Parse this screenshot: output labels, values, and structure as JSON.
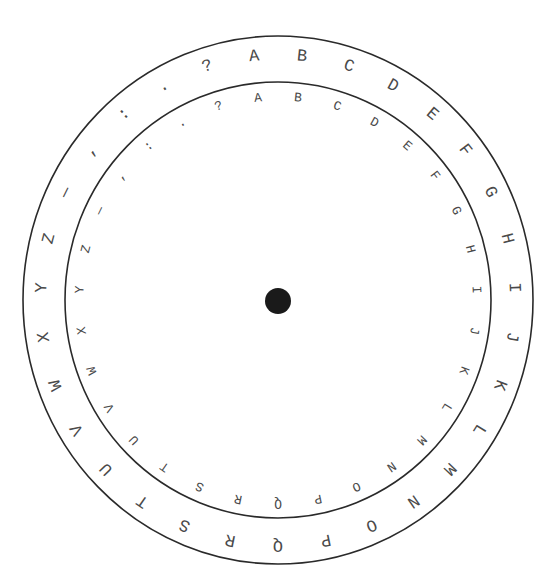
{
  "diagram": {
    "center": {
      "x": 278,
      "y": 300
    },
    "outer_ring": {
      "rx": 255,
      "ry": 264,
      "label_radius": 245
    },
    "inner_ring": {
      "rx": 213,
      "ry": 218,
      "label_radius": 203
    },
    "hub": {
      "r": 13,
      "color": "#1a1a1a"
    },
    "start_angle_deg": -5.8,
    "outer_characters": [
      "A",
      "B",
      "C",
      "D",
      "E",
      "F",
      "G",
      "H",
      "I",
      "J",
      "K",
      "L",
      "M",
      "N",
      "O",
      "P",
      "Q",
      "R",
      "S",
      "T",
      "U",
      "V",
      "W",
      "X",
      "Y",
      "Z",
      "—",
      ",",
      ":",
      ".",
      "?"
    ],
    "inner_characters": [
      "A",
      "B",
      "C",
      "D",
      "E",
      "F",
      "G",
      "H",
      "I",
      "J",
      "K",
      "L",
      "M",
      "N",
      "O",
      "P",
      "Q",
      "R",
      "S",
      "T",
      "U",
      "V",
      "W",
      "X",
      "Y",
      "Z",
      "—",
      ",",
      ":",
      ".",
      "?"
    ],
    "colors": {
      "stroke": "#2a2a2a",
      "text": "#4a4a4a",
      "background": "#ffffff"
    }
  }
}
